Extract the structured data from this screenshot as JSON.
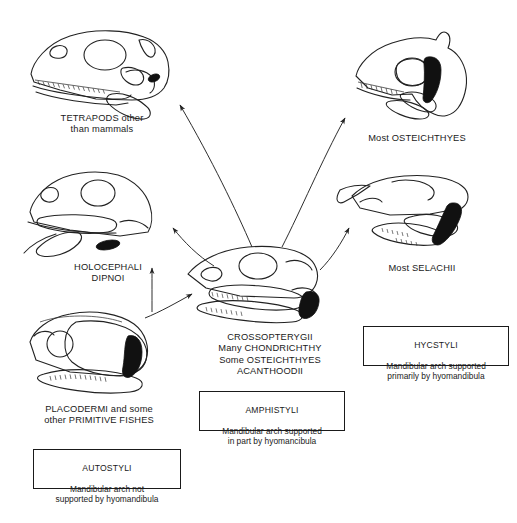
{
  "diagram": {
    "background_color": "#ffffff",
    "ink_color": "#222222",
    "hyomandibula_color": "#111111"
  },
  "labels": [
    {
      "id": "tetrapods",
      "text": "TETRAPODS other\nthan mammals"
    },
    {
      "id": "osteichthyes",
      "text": "Most OSTEICHTHYES"
    },
    {
      "id": "holocephali",
      "text": "HOLOCEPHALI\nDIPNOI"
    },
    {
      "id": "selachii",
      "text": "Most SELACHII"
    },
    {
      "id": "crossopterygii",
      "text": "CROSSOPTERYGII\nMany CHONDRICHTHY\nSome OSTEICHTHYES\nACANTHOODII"
    },
    {
      "id": "placodermi",
      "text": "PLACODERMI and some\nother PRIMITIVE FISHES"
    }
  ],
  "boxes": [
    {
      "id": "autostyli",
      "title": "AUTOSTYLI",
      "body": "Mandibular arch not\nsupported by hyomandibula"
    },
    {
      "id": "amphistyli",
      "title": "AMPHISTYLI",
      "body": "Mandibular arch supported\nin part by hyomancibula"
    },
    {
      "id": "hycstyli",
      "title": "HYCSTYLI",
      "body": "Mandibular arch supported\nprimarily by hyomandibula"
    }
  ],
  "skulls": [
    {
      "id": "skull-tetrapod",
      "caption_ref": "tetrapods",
      "hyomandibula": "small-black-stapes"
    },
    {
      "id": "skull-osteichthyes",
      "caption_ref": "osteichthyes",
      "hyomandibula": "large-black-vertical"
    },
    {
      "id": "skull-holocephali",
      "caption_ref": "holocephali",
      "hyomandibula": "small-black-detached"
    },
    {
      "id": "skull-selachii",
      "caption_ref": "selachii",
      "hyomandibula": "large-black-oblique"
    },
    {
      "id": "skull-crossopterygii",
      "caption_ref": "crossopterygii",
      "hyomandibula": "black-wedge"
    },
    {
      "id": "skull-placodermi",
      "caption_ref": "placodermi",
      "hyomandibula": "black-crescent-detached"
    }
  ],
  "arrows": [
    {
      "id": "arrow-center-to-tetrapods",
      "from": "skull-crossopterygii",
      "to": "skull-tetrapod"
    },
    {
      "id": "arrow-center-to-osteichthyes",
      "from": "skull-crossopterygii",
      "to": "skull-osteichthyes"
    },
    {
      "id": "arrow-center-to-holocephali",
      "from": "skull-crossopterygii",
      "to": "skull-holocephali"
    },
    {
      "id": "arrow-center-to-selachii",
      "from": "skull-crossopterygii",
      "to": "skull-selachii"
    },
    {
      "id": "arrow-placodermi-to-center",
      "from": "skull-placodermi",
      "to": "skull-crossopterygii"
    },
    {
      "id": "arrow-placodermi-to-holocephali",
      "from": "skull-placodermi",
      "to": "skull-holocephali"
    }
  ]
}
